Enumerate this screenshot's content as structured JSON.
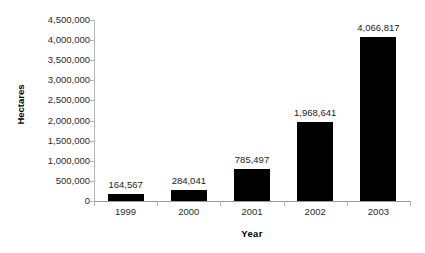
{
  "chart_data": {
    "type": "bar",
    "title": "",
    "xlabel": "Year",
    "ylabel": "Hectares",
    "categories": [
      "1999",
      "2000",
      "2001",
      "2002",
      "2003"
    ],
    "values": [
      164567,
      284041,
      785497,
      1968641,
      4066817
    ],
    "value_labels": [
      "164,567",
      "284,041",
      "785,497",
      "1,968,641",
      "4,066,817"
    ],
    "ylim": [
      0,
      4500000
    ],
    "ytick_values": [
      0,
      500000,
      1000000,
      1500000,
      2000000,
      2500000,
      3000000,
      3500000,
      4000000,
      4500000
    ],
    "ytick_labels": [
      "0",
      "500,000",
      "1,000,000",
      "1,500,000",
      "2,000,000",
      "2,500,000",
      "3,000,000",
      "3,500,000",
      "4,000,000",
      "4,500,000"
    ],
    "grid": false,
    "legend": "none",
    "bar_color": "#000000",
    "axis_color": "#b6b6b6",
    "background": "#ffffff"
  }
}
